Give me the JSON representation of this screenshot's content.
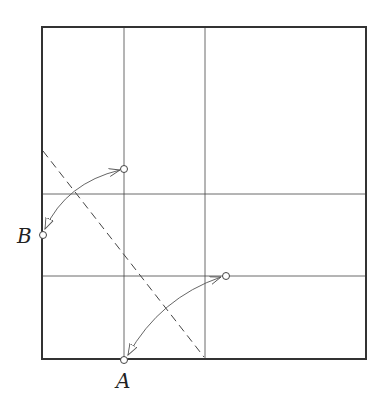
{
  "diagram": {
    "type": "paper-folding",
    "labels": {
      "point_a": "A",
      "point_b": "B"
    },
    "colors": {
      "stroke": "#333333",
      "arrow": "#555555",
      "background": "#ffffff"
    },
    "elements": [
      {
        "kind": "square-outline"
      },
      {
        "kind": "crease",
        "orientation": "vertical",
        "position_fraction": 0.25
      },
      {
        "kind": "crease",
        "orientation": "vertical",
        "position_fraction": 0.5
      },
      {
        "kind": "crease",
        "orientation": "horizontal",
        "position_fraction": 0.5
      },
      {
        "kind": "crease",
        "orientation": "horizontal",
        "position_fraction": 0.75
      },
      {
        "kind": "fold-line",
        "style": "dashed"
      },
      {
        "kind": "arrow",
        "from": "B",
        "to": "upper-point",
        "heads": "both"
      },
      {
        "kind": "arrow",
        "from": "A",
        "to": "lower-point",
        "heads": "both"
      }
    ]
  }
}
